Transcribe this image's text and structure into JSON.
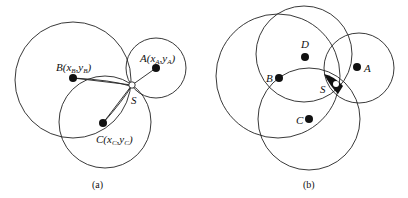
{
  "panels": [
    {
      "id": "a",
      "caption": "(a)",
      "nodes": [
        {
          "name": "A",
          "label_main": "A(x",
          "sub1": "A",
          "mid": ",y",
          "sub2": "A",
          "close": ")"
        },
        {
          "name": "B",
          "label_main": "B(x",
          "sub1": "B",
          "mid": ",y",
          "sub2": "B",
          "close": ")"
        },
        {
          "name": "C",
          "label_main": "C(x",
          "sub1": "C",
          "mid": ",y",
          "sub2": "C",
          "close": ")"
        }
      ],
      "target_label": "S"
    },
    {
      "id": "b",
      "caption": "(b)",
      "nodes": [
        {
          "name": "A",
          "label": "A"
        },
        {
          "name": "B",
          "label": "B"
        },
        {
          "name": "C",
          "label": "C"
        },
        {
          "name": "D",
          "label": "D"
        }
      ],
      "target_label": "S"
    }
  ],
  "colors": {
    "stroke": "#222222",
    "fill_dot": "#111111",
    "background": "#ffffff"
  }
}
